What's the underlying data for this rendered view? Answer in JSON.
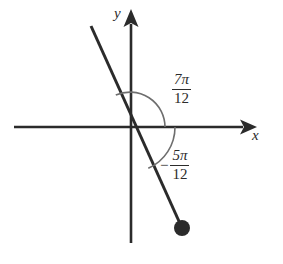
{
  "figure": {
    "background_color": "#ffffff",
    "stroke_color": "#2b2b2b",
    "axes": {
      "x_label": "x",
      "y_label": "y",
      "origin": [
        130,
        127
      ],
      "x_axis_from": [
        14,
        127
      ],
      "x_axis_to": [
        255,
        127
      ],
      "y_axis_from": [
        131,
        243
      ],
      "y_axis_to": [
        131,
        10
      ],
      "arrowheads": [
        "x-positive",
        "y-positive"
      ]
    },
    "terminal_ray": {
      "from": [
        91,
        26
      ],
      "through_origin": [
        130,
        127
      ],
      "to": [
        182,
        228
      ],
      "endpoint_dot": [
        182,
        228
      ],
      "endpoint_dot_radius": 8
    },
    "angles": [
      {
        "name": "positive-angle",
        "label_numerator": "7π",
        "label_denominator": "12",
        "sign": "",
        "direction": "counterclockwise",
        "arc_radius": 35,
        "from_axis": "positive-x",
        "measure_radians": "7π/12",
        "measure_degrees": 105
      },
      {
        "name": "negative-angle",
        "label_numerator": "5π",
        "label_denominator": "12",
        "sign": "−",
        "direction": "clockwise",
        "arc_radius": 45,
        "from_axis": "positive-x",
        "measure_radians": "-5π/12",
        "measure_degrees": -75
      }
    ]
  }
}
